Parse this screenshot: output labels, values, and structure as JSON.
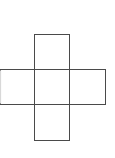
{
  "diagram": {
    "type": "cube-net-cross",
    "stroke_color": "#4a4a4a",
    "faint_edge_color": "#d8d8d8",
    "background": "#ffffff",
    "squares": [
      {
        "id": "top",
        "x": 34.5,
        "y": 34.5,
        "w": 35,
        "h": 35
      },
      {
        "id": "left",
        "x": 0.5,
        "y": 69.5,
        "w": 34,
        "h": 35
      },
      {
        "id": "center",
        "x": 34.5,
        "y": 69.5,
        "w": 35,
        "h": 35
      },
      {
        "id": "right",
        "x": 69.5,
        "y": 69.5,
        "w": 36,
        "h": 35
      },
      {
        "id": "bottom",
        "x": 34.5,
        "y": 104.5,
        "w": 35,
        "h": 36
      }
    ]
  }
}
